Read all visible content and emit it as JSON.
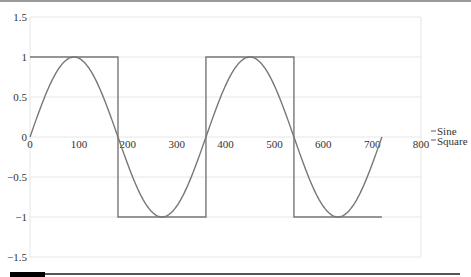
{
  "chart_data": {
    "type": "line",
    "title": "",
    "xlabel": "",
    "ylabel": "",
    "xlim": [
      0,
      800
    ],
    "ylim": [
      -1.5,
      1.5
    ],
    "grid": true,
    "legend_position": "right",
    "x_ticks": [
      "0",
      "100",
      "200",
      "300",
      "400",
      "500",
      "600",
      "700",
      "800"
    ],
    "y_ticks": [
      "1.5",
      "1",
      "0.5",
      "0",
      "-0.5",
      "-1",
      "-1.5"
    ],
    "line_color": "#777777",
    "series": [
      {
        "name": "Sine",
        "x": [
          0,
          45,
          90,
          135,
          180,
          225,
          270,
          315,
          360,
          405,
          450,
          495,
          540,
          585,
          630,
          675,
          720
        ],
        "values": [
          0,
          0.707,
          1,
          0.707,
          0,
          -0.707,
          -1,
          -0.707,
          0,
          0.707,
          1,
          0.707,
          0,
          -0.707,
          -1,
          -0.707,
          0
        ],
        "formula": "sin(x degrees), x in 0..720"
      },
      {
        "name": "Square",
        "x": [
          0,
          180,
          180,
          360,
          360,
          540,
          540,
          720
        ],
        "values": [
          1,
          1,
          -1,
          -1,
          1,
          1,
          -1,
          -1
        ]
      }
    ]
  },
  "legend": {
    "items": [
      {
        "label": "Sine"
      },
      {
        "label": "Square"
      }
    ]
  }
}
